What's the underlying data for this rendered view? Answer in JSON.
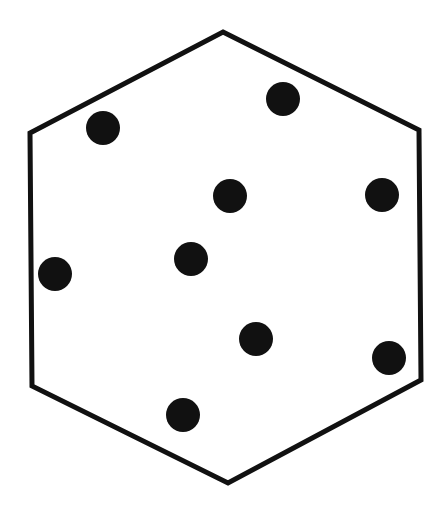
{
  "diagram": {
    "background": "#ffffff",
    "stroke_color": "#111111",
    "fill_color": "#111111",
    "hexagon": {
      "points": [
        [
          223,
          32
        ],
        [
          419,
          130
        ],
        [
          421,
          380
        ],
        [
          228,
          483
        ],
        [
          32,
          386
        ],
        [
          30,
          133
        ]
      ],
      "stroke_width": 5
    },
    "dots": [
      {
        "cx": 103,
        "cy": 128,
        "r": 17
      },
      {
        "cx": 283,
        "cy": 99,
        "r": 17
      },
      {
        "cx": 230,
        "cy": 196,
        "r": 17
      },
      {
        "cx": 382,
        "cy": 195,
        "r": 17
      },
      {
        "cx": 191,
        "cy": 259,
        "r": 17
      },
      {
        "cx": 55,
        "cy": 274,
        "r": 17
      },
      {
        "cx": 256,
        "cy": 339,
        "r": 17
      },
      {
        "cx": 389,
        "cy": 358,
        "r": 17
      },
      {
        "cx": 183,
        "cy": 415,
        "r": 17
      }
    ],
    "dot_count": 9
  }
}
